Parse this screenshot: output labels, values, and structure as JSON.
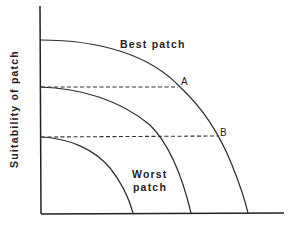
{
  "diagram": {
    "y_axis_label": "Suitability of patch",
    "x_axis_label": "",
    "curves": [
      {
        "name": "best-patch",
        "label": "Best patch"
      },
      {
        "name": "middle-patch",
        "label": ""
      },
      {
        "name": "worst-patch",
        "label_line1": "Worst",
        "label_line2": "patch"
      }
    ],
    "points": [
      {
        "name": "A",
        "label": "A"
      },
      {
        "name": "B",
        "label": "B"
      }
    ],
    "labels": {
      "best": "Best patch",
      "worst_line1": "Worst",
      "worst_line2": "patch",
      "point_a": "A",
      "point_b": "B",
      "y_axis": "Suitability of patch"
    }
  }
}
